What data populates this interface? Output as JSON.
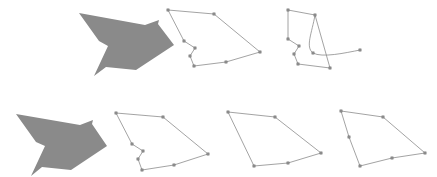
{
  "figure": {
    "width": 437,
    "height": 177
  },
  "style": {
    "background": "#ffffff",
    "fill_gray": "#8a8a8a",
    "fill_gray_stroke": "#7d7d7d",
    "outline_stroke": "#8c8c8c",
    "vertex_fill": "#9a9a9a",
    "vertex_stroke": "#6f6f6f",
    "vertex_size": 2.2,
    "stroke_width": 0.8
  },
  "rows": [
    {
      "name": "top-row",
      "panels": [
        {
          "name": "source-filled-polygon",
          "kind": "filled",
          "vertex_markers": false,
          "points": "79,13 145,25 159,20 158,24 174,45 136,70 106,67 94,76 108,46 99,41"
        },
        {
          "name": "outlined-polygon-full",
          "kind": "outline",
          "vertex_markers": true,
          "points": "168,10 214,14 260,52 226,62 194,66 190,56 195,48 184,41",
          "vertices": [
            "168,10",
            "214,14",
            "260,52",
            "226,62",
            "194,66",
            "190,56",
            "195,48",
            "184,41"
          ]
        },
        {
          "name": "outlined-polygon-with-arc",
          "kind": "outline-arc",
          "vertex_markers": true,
          "points": "288,10 315,15 330,68 298,64 294,54 299,46 288,39",
          "arc_path": "M 315,15 C 312,33 305,47 313,53 C 322,58 345,53 360,50",
          "arc_endpoints": [
            "315,15",
            "360,50"
          ],
          "vertices": [
            "288,10",
            "315,15",
            "330,68",
            "298,64",
            "294,54",
            "299,46",
            "288,39",
            "313,53",
            "360,50"
          ]
        }
      ]
    },
    {
      "name": "bottom-row",
      "panels": [
        {
          "name": "source-filled-polygon",
          "kind": "filled",
          "vertex_markers": false,
          "points": "16,114 80,125 93,120 92,124 107,146 71,170 42,167 31,176 45,146 36,142"
        },
        {
          "name": "outlined-polygon-full",
          "kind": "outline",
          "vertex_markers": true,
          "points": "116,113 163,117 208,154 174,165 142,170 138,159 143,151 132,144",
          "vertices": [
            "116,113",
            "163,117",
            "208,154",
            "174,165",
            "142,170",
            "138,159",
            "143,151",
            "132,144"
          ]
        },
        {
          "name": "outlined-polygon-simplified",
          "kind": "outline",
          "vertex_markers": true,
          "points": "228,112 275,117 321,153 288,163 254,166",
          "vertices": [
            "228,112",
            "275,117",
            "321,153",
            "288,163",
            "254,166"
          ]
        },
        {
          "name": "outlined-polygon-minimal",
          "kind": "outline",
          "vertex_markers": true,
          "points": "341,111 383,117 425,153 392,158 360,166 349,137",
          "vertices": [
            "341,111",
            "383,117",
            "425,153",
            "392,158",
            "360,166",
            "349,137"
          ]
        }
      ]
    }
  ]
}
